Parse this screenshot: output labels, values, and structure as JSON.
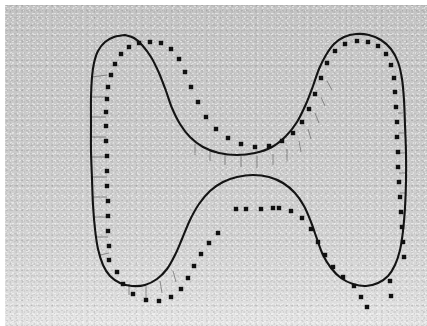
{
  "figure": {
    "title": "Contour fit with sampled boundary points",
    "kind": "scanned-grayscale-plate",
    "width_px": 427,
    "height_px": 326,
    "colors": {
      "page": "#ffffff",
      "scan_background_top": "#c4c4c4",
      "scan_background_bottom": "#e6e6e6",
      "contour_stroke": "#141414",
      "sample_dot": "#101010",
      "whisker_stroke": "#5d5d5d"
    },
    "legend_text": "",
    "axis_labels": [],
    "tick_labels": []
  },
  "chart_data": {
    "type": "scatter",
    "title": "Contour fit with sampled boundary points",
    "subtitle": "",
    "xlabel": "",
    "ylabel": "",
    "xlim": [
      0,
      422
    ],
    "ylim": [
      0,
      321
    ],
    "grid": false,
    "legend_position": "none",
    "annotations": [],
    "series": [
      {
        "name": "model-contour",
        "type": "line",
        "closed": true,
        "stroke": "#141414",
        "stroke_width": 2.1,
        "note": "continuous closed boundary curve (bone / U-shaped outline)",
        "points": [
          [
            120,
            30
          ],
          [
            109,
            32
          ],
          [
            100,
            37
          ],
          [
            93,
            46
          ],
          [
            89,
            58
          ],
          [
            87,
            72
          ],
          [
            86,
            92
          ],
          [
            86,
            118
          ],
          [
            86,
            146
          ],
          [
            87,
            174
          ],
          [
            88,
            200
          ],
          [
            90,
            224
          ],
          [
            93,
            244
          ],
          [
            98,
            260
          ],
          [
            105,
            271
          ],
          [
            115,
            278
          ],
          [
            127,
            281
          ],
          [
            140,
            280
          ],
          [
            152,
            274
          ],
          [
            162,
            264
          ],
          [
            170,
            250
          ],
          [
            177,
            234
          ],
          [
            185,
            215
          ],
          [
            194,
            199
          ],
          [
            205,
            186
          ],
          [
            218,
            177
          ],
          [
            232,
            172
          ],
          [
            248,
            170
          ],
          [
            264,
            172
          ],
          [
            278,
            178
          ],
          [
            290,
            188
          ],
          [
            299,
            201
          ],
          [
            306,
            217
          ],
          [
            312,
            234
          ],
          [
            318,
            250
          ],
          [
            326,
            263
          ],
          [
            336,
            273
          ],
          [
            348,
            279
          ],
          [
            361,
            281
          ],
          [
            373,
            278
          ],
          [
            383,
            271
          ],
          [
            390,
            260
          ],
          [
            395,
            245
          ],
          [
            398,
            226
          ],
          [
            400,
            203
          ],
          [
            401,
            176
          ],
          [
            401,
            148
          ],
          [
            400,
            120
          ],
          [
            399,
            95
          ],
          [
            397,
            74
          ],
          [
            393,
            57
          ],
          [
            386,
            44
          ],
          [
            376,
            35
          ],
          [
            364,
            30
          ],
          [
            351,
            29
          ],
          [
            339,
            32
          ],
          [
            329,
            39
          ],
          [
            321,
            50
          ],
          [
            314,
            64
          ],
          [
            308,
            81
          ],
          [
            301,
            99
          ],
          [
            292,
            117
          ],
          [
            281,
            131
          ],
          [
            267,
            142
          ],
          [
            250,
            148
          ],
          [
            232,
            150
          ],
          [
            214,
            148
          ],
          [
            198,
            142
          ],
          [
            185,
            132
          ],
          [
            175,
            119
          ],
          [
            167,
            103
          ],
          [
            161,
            86
          ],
          [
            154,
            68
          ],
          [
            146,
            52
          ],
          [
            137,
            40
          ],
          [
            129,
            33
          ],
          [
            120,
            30
          ]
        ]
      },
      {
        "name": "measured-samples",
        "type": "scatter",
        "marker": "square",
        "marker_size_px": 4.4,
        "fill": "#101010",
        "note": "discrete sampled boundary points; short whiskers join each sample to its nearest contour location",
        "points": [
          [
            104,
            255
          ],
          [
            104,
            241
          ],
          [
            103,
            226
          ],
          [
            103,
            211
          ],
          [
            103,
            196
          ],
          [
            102,
            181
          ],
          [
            102,
            166
          ],
          [
            102,
            151
          ],
          [
            101,
            136
          ],
          [
            101,
            121
          ],
          [
            101,
            107
          ],
          [
            102,
            94
          ],
          [
            103,
            82
          ],
          [
            106,
            70
          ],
          [
            110,
            59
          ],
          [
            116,
            49
          ],
          [
            124,
            42
          ],
          [
            134,
            38
          ],
          [
            145,
            37
          ],
          [
            156,
            38
          ],
          [
            166,
            44
          ],
          [
            174,
            54
          ],
          [
            180,
            67
          ],
          [
            186,
            82
          ],
          [
            193,
            97
          ],
          [
            201,
            112
          ],
          [
            211,
            124
          ],
          [
            223,
            133
          ],
          [
            236,
            139
          ],
          [
            250,
            142
          ],
          [
            264,
            141
          ],
          [
            277,
            136
          ],
          [
            288,
            128
          ],
          [
            297,
            117
          ],
          [
            304,
            104
          ],
          [
            310,
            89
          ],
          [
            316,
            73
          ],
          [
            322,
            58
          ],
          [
            330,
            46
          ],
          [
            340,
            39
          ],
          [
            352,
            36
          ],
          [
            363,
            37
          ],
          [
            373,
            41
          ],
          [
            381,
            49
          ],
          [
            386,
            60
          ],
          [
            389,
            73
          ],
          [
            390,
            87
          ],
          [
            391,
            102
          ],
          [
            392,
            117
          ],
          [
            392,
            132
          ],
          [
            393,
            147
          ],
          [
            393,
            162
          ],
          [
            394,
            177
          ],
          [
            395,
            192
          ],
          [
            396,
            207
          ],
          [
            397,
            222
          ],
          [
            398,
            237
          ],
          [
            399,
            252
          ],
          [
            112,
            267
          ],
          [
            118,
            279
          ],
          [
            128,
            289
          ],
          [
            141,
            295
          ],
          [
            154,
            296
          ],
          [
            166,
            292
          ],
          [
            176,
            284
          ],
          [
            183,
            273
          ],
          [
            189,
            261
          ],
          [
            196,
            249
          ],
          [
            204,
            238
          ],
          [
            213,
            228
          ],
          [
            231,
            204
          ],
          [
            241,
            204
          ],
          [
            256,
            204
          ],
          [
            268,
            203
          ],
          [
            274,
            203
          ],
          [
            286,
            206
          ],
          [
            297,
            213
          ],
          [
            306,
            224
          ],
          [
            313,
            237
          ],
          [
            320,
            250
          ],
          [
            328,
            262
          ],
          [
            338,
            272
          ],
          [
            349,
            281
          ],
          [
            356,
            292
          ],
          [
            362,
            302
          ],
          [
            385,
            276
          ],
          [
            386,
            291
          ]
        ]
      }
    ],
    "whiskers": {
      "note": "faint hairlines connecting contour to each nearby sample point",
      "pairs": [
        [
          [
            87,
            72
          ],
          [
            102,
            70
          ]
        ],
        [
          [
            86,
            92
          ],
          [
            101,
            92
          ]
        ],
        [
          [
            86,
            112
          ],
          [
            101,
            112
          ]
        ],
        [
          [
            86,
            132
          ],
          [
            101,
            132
          ]
        ],
        [
          [
            86,
            152
          ],
          [
            102,
            152
          ]
        ],
        [
          [
            87,
            172
          ],
          [
            102,
            172
          ]
        ],
        [
          [
            88,
            192
          ],
          [
            102,
            192
          ]
        ],
        [
          [
            89,
            212
          ],
          [
            103,
            212
          ]
        ],
        [
          [
            91,
            232
          ],
          [
            103,
            232
          ]
        ],
        [
          [
            95,
            250
          ],
          [
            104,
            248
          ]
        ],
        [
          [
            190,
            139
          ],
          [
            190,
            150
          ]
        ],
        [
          [
            205,
            145
          ],
          [
            205,
            156
          ]
        ],
        [
          [
            220,
            149
          ],
          [
            220,
            160
          ]
        ],
        [
          [
            236,
            151
          ],
          [
            236,
            162
          ]
        ],
        [
          [
            252,
            151
          ],
          [
            252,
            163
          ]
        ],
        [
          [
            268,
            149
          ],
          [
            268,
            160
          ]
        ],
        [
          [
            282,
            144
          ],
          [
            282,
            156
          ]
        ],
        [
          [
            294,
            136
          ],
          [
            296,
            147
          ]
        ],
        [
          [
            303,
            124
          ],
          [
            306,
            134
          ]
        ],
        [
          [
            310,
            108
          ],
          [
            314,
            118
          ]
        ],
        [
          [
            316,
            92
          ],
          [
            320,
            101
          ]
        ],
        [
          [
            322,
            76
          ],
          [
            327,
            85
          ]
        ],
        [
          [
            398,
            108
          ],
          [
            393,
            108
          ]
        ],
        [
          [
            399,
            128
          ],
          [
            393,
            128
          ]
        ],
        [
          [
            400,
            148
          ],
          [
            394,
            148
          ]
        ],
        [
          [
            400,
            168
          ],
          [
            394,
            168
          ]
        ],
        [
          [
            400,
            188
          ],
          [
            395,
            188
          ]
        ],
        [
          [
            399,
            208
          ],
          [
            396,
            208
          ]
        ],
        [
          [
            124,
            279
          ],
          [
            124,
            290
          ]
        ],
        [
          [
            141,
            281
          ],
          [
            141,
            293
          ]
        ],
        [
          [
            155,
            276
          ],
          [
            157,
            288
          ]
        ],
        [
          [
            168,
            266
          ],
          [
            171,
            277
          ]
        ]
      ]
    }
  }
}
